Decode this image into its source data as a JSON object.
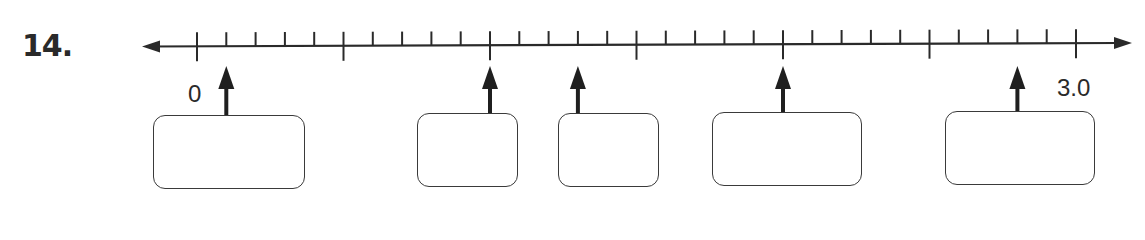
{
  "problem": {
    "number": "14."
  },
  "number_line": {
    "start_label": "0",
    "end_label": "3.0",
    "min": 0,
    "max": 3.0,
    "major_step": 0.5,
    "minor_step": 0.1,
    "line_color": "#2a2a2a"
  },
  "pointers": [
    {
      "value": 0.1,
      "answer": ""
    },
    {
      "value": 1.0,
      "answer": ""
    },
    {
      "value": 1.3,
      "answer": ""
    },
    {
      "value": 2.0,
      "answer": ""
    },
    {
      "value": 2.8,
      "answer": ""
    }
  ]
}
